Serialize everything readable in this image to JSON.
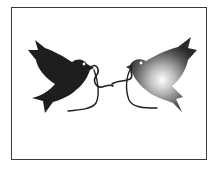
{
  "illustration": {
    "subject": "two doves facing each other holding an intertwined ribbon",
    "left_dove": {
      "fill": "#1e1e1e",
      "style": "solid"
    },
    "right_dove": {
      "fill_dark": "#2a2a2a",
      "fill_light": "#ffffff",
      "style": "radial-gradient"
    },
    "ribbon": {
      "stroke": "#1e1e1e"
    },
    "frame": {
      "border": "#3a3a3a",
      "background": "#ffffff"
    }
  }
}
